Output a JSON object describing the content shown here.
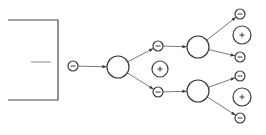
{
  "diagram": {
    "type": "branching-tree",
    "colors": {
      "line": "#4a4a4a",
      "edge": "#6a6a6a",
      "node_stroke": "#3a3a3a",
      "background": "#ffffff"
    },
    "bracket": {
      "top_y": 20,
      "bottom_y": 100,
      "left_x": 8,
      "right_x": 58,
      "inner_line": {
        "x1": 31,
        "x2": 51,
        "y": 62
      }
    },
    "nodes": [
      {
        "id": "minus-0",
        "kind": "minus",
        "cx": 73,
        "cy": 66,
        "r": 5
      },
      {
        "id": "big-0",
        "kind": "big",
        "cx": 118,
        "cy": 67,
        "r": 11
      },
      {
        "id": "minus-1a",
        "kind": "minus",
        "cx": 158,
        "cy": 46,
        "r": 5
      },
      {
        "id": "plus-1",
        "kind": "plus",
        "cx": 160,
        "cy": 69,
        "r": 8
      },
      {
        "id": "minus-1b",
        "kind": "minus",
        "cx": 158,
        "cy": 92,
        "r": 5
      },
      {
        "id": "big-2a",
        "kind": "big",
        "cx": 198,
        "cy": 47,
        "r": 11
      },
      {
        "id": "big-2b",
        "kind": "big",
        "cx": 198,
        "cy": 91,
        "r": 11
      },
      {
        "id": "minus-3a",
        "kind": "minus",
        "cx": 240,
        "cy": 14,
        "r": 5
      },
      {
        "id": "plus-3a",
        "kind": "plus",
        "cx": 242,
        "cy": 35,
        "r": 9
      },
      {
        "id": "minus-3b",
        "kind": "minus",
        "cx": 240,
        "cy": 57,
        "r": 5
      },
      {
        "id": "minus-3c",
        "kind": "minus",
        "cx": 240,
        "cy": 76,
        "r": 5
      },
      {
        "id": "plus-3b",
        "kind": "plus",
        "cx": 242,
        "cy": 97,
        "r": 9
      },
      {
        "id": "minus-3d",
        "kind": "minus",
        "cx": 240,
        "cy": 118,
        "r": 5
      }
    ],
    "edges": [
      {
        "from": "minus-0",
        "to": "big-0"
      },
      {
        "from": "big-0",
        "to": "minus-1a"
      },
      {
        "from": "big-0",
        "to": "minus-1b"
      },
      {
        "from": "minus-1a",
        "to": "big-2a"
      },
      {
        "from": "minus-1b",
        "to": "big-2b"
      },
      {
        "from": "big-2a",
        "to": "minus-3a"
      },
      {
        "from": "big-2a",
        "to": "minus-3b"
      },
      {
        "from": "big-2b",
        "to": "minus-3c"
      },
      {
        "from": "big-2b",
        "to": "minus-3d"
      }
    ]
  }
}
